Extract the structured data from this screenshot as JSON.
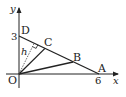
{
  "diagram": {
    "type": "coordinate-geometry",
    "axes": {
      "x_label": "x",
      "y_label": "y",
      "origin_label": "O"
    },
    "points": {
      "O": {
        "label": "O",
        "coord": [
          0,
          0
        ]
      },
      "A": {
        "label": "A",
        "coord": [
          6,
          0
        ]
      },
      "D": {
        "label": "D",
        "coord": [
          0,
          3
        ]
      },
      "B": {
        "label": "B"
      },
      "C": {
        "label": "C"
      }
    },
    "tick_labels": {
      "x_tick": "6",
      "y_tick": "3"
    },
    "segments": [
      "D-A",
      "O-B",
      "O-C"
    ],
    "perpendicular": {
      "label": "h",
      "from": "O",
      "to_line": "D-A",
      "style": "dashed",
      "right_angle_mark": true
    },
    "colors": {
      "stroke": "#222222",
      "background": "#ffffff"
    }
  }
}
